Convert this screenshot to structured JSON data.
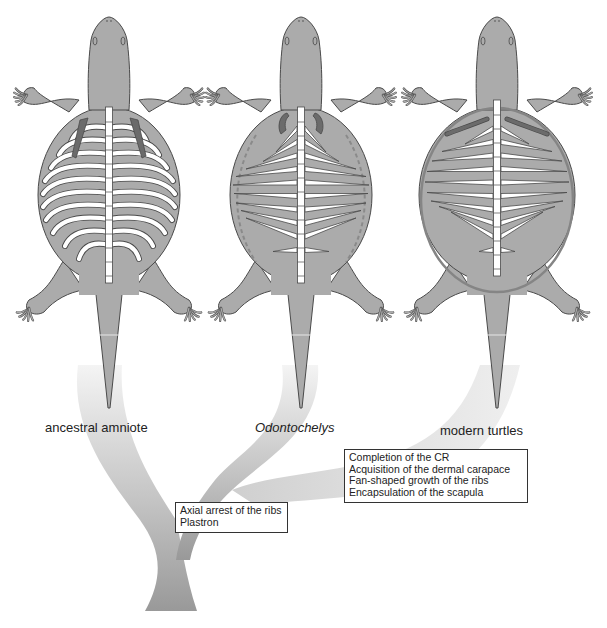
{
  "figure": {
    "taxa": [
      {
        "id": "ancestral-amniote",
        "label": "ancestral amniote",
        "italic": false,
        "ribs": "curved",
        "shell": "none"
      },
      {
        "id": "odontochelys",
        "label": "Odontochelys",
        "italic": true,
        "ribs": "straight-fan",
        "shell": "plastron-only"
      },
      {
        "id": "modern-turtles",
        "label": "modern turtles",
        "italic": false,
        "ribs": "fan-encapsulated",
        "shell": "carapace"
      }
    ],
    "trait_boxes": [
      {
        "id": "node-1",
        "lines": [
          "Axial arrest of the ribs",
          "Plastron"
        ]
      },
      {
        "id": "node-2",
        "lines": [
          "Completion of the CR",
          "Acquisition of the dermal carapace",
          "Fan-shaped growth of the ribs",
          "Encapsulation of the scapula"
        ]
      }
    ],
    "colors": {
      "body": "#ababab",
      "outline": "#4a4a4a",
      "bone": "#ffffff",
      "scapula": "#6b6b6b",
      "carapace_rim": "#858585",
      "dashed_margin": "#8a8a8a",
      "tree_dark": "#9a9a9a",
      "tree_light": "#f2f2f2"
    }
  }
}
